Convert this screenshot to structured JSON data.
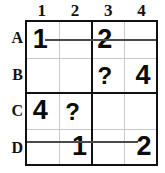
{
  "puzzle": {
    "type": "4x4-latin-square-grid",
    "columns": [
      "1",
      "2",
      "3",
      "4"
    ],
    "rows": [
      "A",
      "B",
      "C",
      "D"
    ],
    "unknown_marker": "?",
    "colors": {
      "border": "#111111",
      "gridline": "#c9c9c9",
      "text": "#0a0a0a",
      "connector": "#4a4a4a",
      "background": "#ffffff"
    },
    "cells": [
      {
        "id": "A1",
        "row": "A",
        "col": "1",
        "value": "1"
      },
      {
        "id": "A2",
        "row": "A",
        "col": "2",
        "value": ""
      },
      {
        "id": "A3",
        "row": "A",
        "col": "3",
        "value": "2"
      },
      {
        "id": "A4",
        "row": "A",
        "col": "4",
        "value": ""
      },
      {
        "id": "B1",
        "row": "B",
        "col": "1",
        "value": ""
      },
      {
        "id": "B2",
        "row": "B",
        "col": "2",
        "value": ""
      },
      {
        "id": "B3",
        "row": "B",
        "col": "3",
        "value": "?"
      },
      {
        "id": "B4",
        "row": "B",
        "col": "4",
        "value": "4"
      },
      {
        "id": "C1",
        "row": "C",
        "col": "1",
        "value": "4"
      },
      {
        "id": "C2",
        "row": "C",
        "col": "2",
        "value": "?"
      },
      {
        "id": "C3",
        "row": "C",
        "col": "3",
        "value": ""
      },
      {
        "id": "C4",
        "row": "C",
        "col": "4",
        "value": ""
      },
      {
        "id": "D1",
        "row": "D",
        "col": "1",
        "value": ""
      },
      {
        "id": "D2",
        "row": "D",
        "col": "2",
        "value": "1"
      },
      {
        "id": "D3",
        "row": "D",
        "col": "3",
        "value": ""
      },
      {
        "id": "D4",
        "row": "D",
        "col": "4",
        "value": "2"
      }
    ],
    "connectors": [
      {
        "id": "row-a-connector",
        "row": "A",
        "from": "A1",
        "to": "right-edge"
      },
      {
        "id": "row-d-connector",
        "row": "D",
        "from": "left-edge",
        "to": "D4"
      }
    ]
  }
}
